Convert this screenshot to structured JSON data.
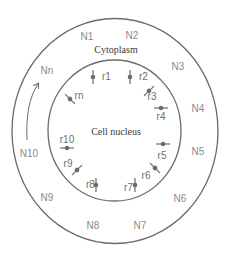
{
  "diagram": {
    "colors": {
      "stroke": "#6b6b6b",
      "text_outer": "#8a8a8a",
      "text_receptor": "#6e6e6e",
      "text_title": "#3a3a3a"
    },
    "outer_region": {
      "label": "Cytoplasm"
    },
    "inner_region": {
      "label": "Cell nucleus"
    },
    "outer_nodes": [
      {
        "id": "N1",
        "label": "N1",
        "x": 87,
        "y": 40
      },
      {
        "id": "N2",
        "label": "N2",
        "x": 132,
        "y": 39
      },
      {
        "id": "N3",
        "label": "N3",
        "x": 178,
        "y": 70
      },
      {
        "id": "N4",
        "label": "N4",
        "x": 198,
        "y": 112
      },
      {
        "id": "N5",
        "label": "N5",
        "x": 198,
        "y": 155
      },
      {
        "id": "N6",
        "label": "N6",
        "x": 180,
        "y": 202
      },
      {
        "id": "N7",
        "label": "N7",
        "x": 140,
        "y": 229
      },
      {
        "id": "N8",
        "label": "N8",
        "x": 93,
        "y": 229
      },
      {
        "id": "N9",
        "label": "N9",
        "x": 47,
        "y": 201
      },
      {
        "id": "N10",
        "label": "N10",
        "x": 29,
        "y": 157
      },
      {
        "id": "Nn",
        "label": "Nn",
        "x": 47,
        "y": 74
      }
    ],
    "receptors": [
      {
        "id": "r1",
        "label": "r1",
        "cx": 93,
        "cy": 77,
        "angle": 90,
        "lx": 102,
        "ly": 80
      },
      {
        "id": "r2",
        "label": "r2",
        "cx": 130,
        "cy": 77,
        "angle": 90,
        "lx": 139,
        "ly": 80
      },
      {
        "id": "r3",
        "label": "r3",
        "cx": 149,
        "cy": 91,
        "angle": -45,
        "lx": 152,
        "ly": 100
      },
      {
        "id": "r4",
        "label": "r4",
        "cx": 161,
        "cy": 108,
        "angle": 0,
        "lx": 161,
        "ly": 120
      },
      {
        "id": "r5",
        "label": "r5",
        "cx": 163,
        "cy": 144,
        "angle": 0,
        "lx": 162,
        "ly": 159
      },
      {
        "id": "r6",
        "label": "r6",
        "cx": 155,
        "cy": 168,
        "angle": 45,
        "lx": 146,
        "ly": 179
      },
      {
        "id": "r7",
        "label": "r7",
        "cx": 135,
        "cy": 185,
        "angle": 90,
        "lx": 124,
        "ly": 191
      },
      {
        "id": "r8",
        "label": "r8",
        "cx": 96,
        "cy": 185,
        "angle": 90,
        "lx": 86,
        "ly": 188
      },
      {
        "id": "r9",
        "label": "r9",
        "cx": 77,
        "cy": 170,
        "angle": -45,
        "lx": 68,
        "ly": 167
      },
      {
        "id": "r10",
        "label": "r10",
        "cx": 67,
        "cy": 148,
        "angle": 0,
        "lx": 67,
        "ly": 143
      },
      {
        "id": "rn",
        "label": "rn",
        "cx": 70,
        "cy": 99,
        "angle": 45,
        "lx": 79,
        "ly": 99
      }
    ],
    "arrow": {
      "description": "curved arrow from N10 toward Nn indicating sequence direction"
    }
  }
}
